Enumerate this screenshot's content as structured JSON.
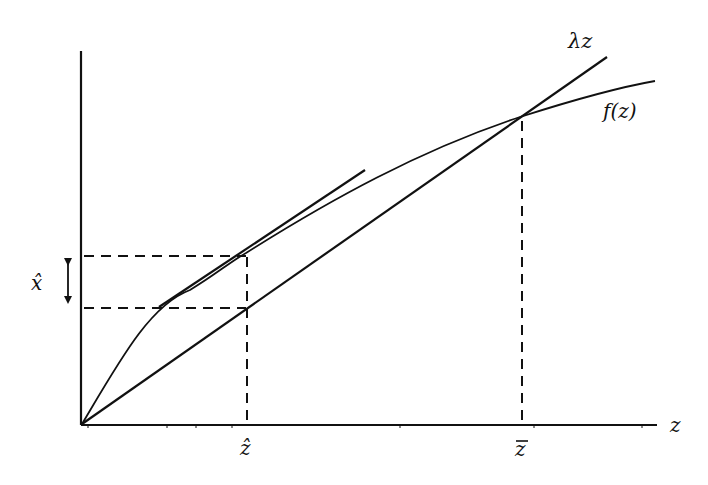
{
  "diagram": {
    "type": "economics-function-diagram",
    "colors": {
      "ink": "#111111",
      "background": "#ffffff"
    },
    "axes": {
      "x_label": "z",
      "origin": [
        82,
        424
      ],
      "x_axis_end": [
        657,
        424
      ],
      "y_axis_top": [
        81,
        51
      ]
    },
    "curves": {
      "linear": {
        "label": "λz",
        "from": [
          82,
          424
        ],
        "to": [
          607,
          57
        ]
      },
      "concave": {
        "label": "f(z)",
        "points": [
          [
            82,
            424
          ],
          [
            246,
            253
          ],
          [
            520,
            117
          ],
          [
            655,
            81
          ]
        ]
      },
      "tangent": {
        "from": [
          159,
          307
        ],
        "to": [
          365,
          170
        ]
      }
    },
    "markers": {
      "z_hat": {
        "label": "ẑ",
        "x": 247,
        "top_y": 253
      },
      "z_bar": {
        "label": "z̄",
        "x": 522,
        "top_y": 120
      },
      "x_hat": {
        "label": "x̂",
        "upper_y": 256,
        "lower_y": 308
      }
    },
    "labels": {
      "lambda_z": "λz",
      "f_z": "f(z)",
      "z_axis": "z",
      "z_hat": "ẑ",
      "z_bar": "z",
      "x_hat": "x̂"
    }
  }
}
